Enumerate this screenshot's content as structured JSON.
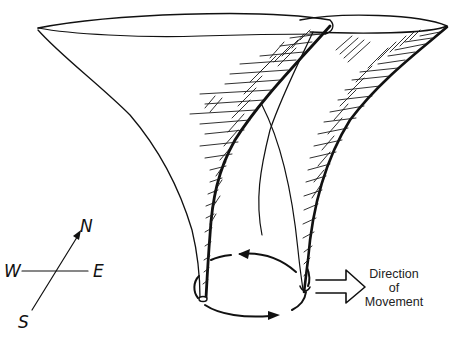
{
  "diagram": {
    "elements": [
      "left-funnel",
      "right-funnel",
      "rotation-circle-arrows",
      "compass",
      "direction-arrow"
    ],
    "compass": {
      "north": "N",
      "south": "S",
      "east": "E",
      "west": "W"
    },
    "movement": {
      "line1": "Direction",
      "line2": "of",
      "line3": "Movement"
    },
    "colors": {
      "ink": "#111111",
      "background": "#ffffff"
    }
  }
}
